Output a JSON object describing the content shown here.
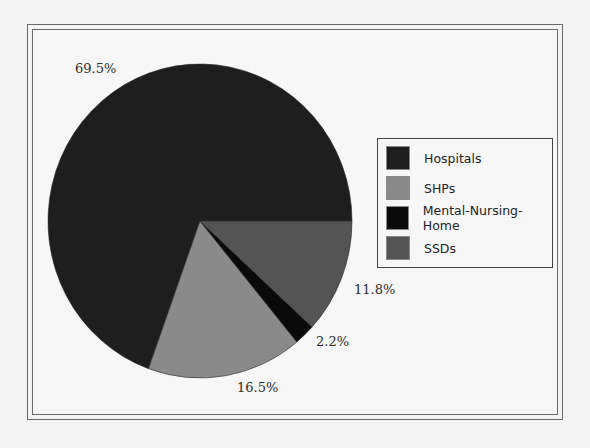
{
  "chart_data": {
    "type": "pie",
    "title": "",
    "categories": [
      "Hospitals",
      "SHPs",
      "Mental-Nursing-Home",
      "SSDs"
    ],
    "values": [
      69.5,
      16.5,
      2.2,
      11.8
    ],
    "labels": [
      "69.5%",
      "16.5%",
      "2.2%",
      "11.8%"
    ],
    "colors": [
      "#1e1e1e",
      "#8a8a8a",
      "#0a0a0a",
      "#545454"
    ],
    "start_angle_deg": 0,
    "direction": "counterclockwise",
    "legend_position": "right",
    "legend": [
      "Hospitals",
      "SHPs",
      "Mental-Nursing-Home",
      "SSDs"
    ]
  },
  "legend": {
    "items": [
      {
        "label": "Hospitals",
        "color": "#1e1e1e"
      },
      {
        "label": "SHPs",
        "color": "#8a8a8a"
      },
      {
        "label": "Mental-Nursing-Home",
        "color": "#0a0a0a"
      },
      {
        "label": "SSDs",
        "color": "#545454"
      }
    ]
  },
  "slice_labels": {
    "hospitals": "69.5%",
    "shps": "16.5%",
    "mental_nursing_home": "2.2%",
    "ssds": "11.8%"
  }
}
